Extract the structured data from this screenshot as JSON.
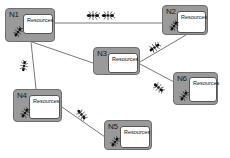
{
  "diagram": {
    "type": "network",
    "nodes": [
      {
        "id": "N1",
        "label": "N1",
        "resource_label": "Resources",
        "has_ant": true
      },
      {
        "id": "N2",
        "label": "N2",
        "resource_label": "Resources",
        "has_ant": true
      },
      {
        "id": "N3",
        "label": "N3",
        "resource_label": "Resources",
        "has_ant": false
      },
      {
        "id": "N4",
        "label": "N4",
        "resource_label": "Resources",
        "has_ant": true
      },
      {
        "id": "N5",
        "label": "N5",
        "resource_label": "Resources",
        "has_ant": true
      },
      {
        "id": "N6",
        "label": "N6",
        "resource_label": "Resources",
        "has_ant": true
      }
    ],
    "edges": [
      {
        "from": "N1",
        "to": "N2",
        "ants_on_edge": 2
      },
      {
        "from": "N1",
        "to": "N3",
        "ants_on_edge": 0
      },
      {
        "from": "N1",
        "to": "N4",
        "ants_on_edge": 1
      },
      {
        "from": "N3",
        "to": "N2",
        "ants_on_edge": 1
      },
      {
        "from": "N3",
        "to": "N6",
        "ants_on_edge": 1
      },
      {
        "from": "N4",
        "to": "N5",
        "ants_on_edge": 1
      }
    ],
    "icons": {
      "agent": "ant-icon"
    },
    "colors": {
      "node_fill": "#9a9a9a",
      "resource_fill": "#ffffff",
      "edge": "#555555",
      "ant": "#111111"
    }
  }
}
